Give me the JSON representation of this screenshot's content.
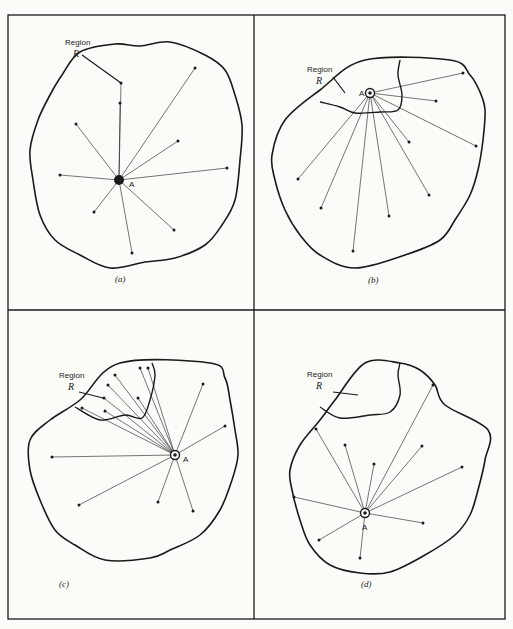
{
  "figure": {
    "frame": {
      "x": 8,
      "y": 15,
      "width": 497,
      "height": 604,
      "split_x": 254,
      "split_y": 310
    },
    "colors": {
      "ink": "#1a1a1a",
      "paper": "#fbfbf8"
    },
    "region_label": "Region",
    "region_symbol": "R",
    "point_label": "A",
    "panels": [
      {
        "id": "a",
        "caption": "(a)",
        "caption_pos": [
          115,
          282
        ],
        "outline": [
          [
            62,
            75
          ],
          [
            80,
            52
          ],
          [
            115,
            44
          ],
          [
            140,
            46
          ],
          [
            170,
            42
          ],
          [
            205,
            55
          ],
          [
            225,
            70
          ],
          [
            235,
            95
          ],
          [
            242,
            125
          ],
          [
            240,
            160
          ],
          [
            235,
            200
          ],
          [
            222,
            225
          ],
          [
            205,
            245
          ],
          [
            175,
            258
          ],
          [
            145,
            262
          ],
          [
            110,
            268
          ],
          [
            80,
            255
          ],
          [
            55,
            240
          ],
          [
            40,
            215
          ],
          [
            33,
            180
          ],
          [
            30,
            150
          ],
          [
            38,
            120
          ],
          [
            50,
            95
          ]
        ],
        "subregion": null,
        "region_text_pos": [
          65,
          45
        ],
        "region_sym_pos": [
          73,
          57
        ],
        "arrow": [
          [
            82,
            55
          ],
          [
            121,
            83
          ]
        ],
        "A": [
          119,
          180
        ],
        "A_label_pos": [
          129,
          187
        ],
        "points": [
          [
            121,
            83
          ],
          [
            120,
            103
          ],
          [
            195,
            68
          ],
          [
            76,
            124
          ],
          [
            178,
            141
          ],
          [
            60,
            175
          ],
          [
            227,
            168
          ],
          [
            94,
            212
          ],
          [
            174,
            230
          ],
          [
            132,
            253
          ]
        ]
      },
      {
        "id": "b",
        "caption": "(b)",
        "caption_pos": [
          368,
          283
        ],
        "outline": [
          [
            365,
            60
          ],
          [
            450,
            60
          ],
          [
            470,
            75
          ],
          [
            480,
            92
          ],
          [
            485,
            110
          ],
          [
            483,
            140
          ],
          [
            478,
            170
          ],
          [
            470,
            195
          ],
          [
            455,
            220
          ],
          [
            440,
            240
          ],
          [
            405,
            255
          ],
          [
            355,
            268
          ],
          [
            320,
            255
          ],
          [
            300,
            235
          ],
          [
            285,
            210
          ],
          [
            275,
            180
          ],
          [
            272,
            155
          ],
          [
            285,
            120
          ],
          [
            320,
            90
          ]
        ],
        "subregion": [
          [
            320,
            102
          ],
          [
            340,
            107
          ],
          [
            355,
            113
          ],
          [
            380,
            112
          ],
          [
            398,
            110
          ],
          [
            402,
            95
          ],
          [
            398,
            75
          ],
          [
            400,
            60
          ]
        ],
        "region_text_pos": [
          307,
          72
        ],
        "region_sym_pos": [
          316,
          84
        ],
        "arrow": [
          [
            333,
            77
          ],
          [
            345,
            93
          ]
        ],
        "A": [
          370,
          93
        ],
        "A_label_pos": [
          359,
          96
        ],
        "points": [
          [
            463,
            73
          ],
          [
            436,
            101
          ],
          [
            476,
            146
          ],
          [
            409,
            142
          ],
          [
            298,
            179
          ],
          [
            321,
            208
          ],
          [
            353,
            251
          ],
          [
            389,
            216
          ],
          [
            429,
            195
          ]
        ]
      },
      {
        "id": "c",
        "caption": "(c)",
        "caption_pos": [
          59,
          587
        ],
        "outline": [
          [
            120,
            363
          ],
          [
            210,
            363
          ],
          [
            225,
            378
          ],
          [
            230,
            400
          ],
          [
            235,
            430
          ],
          [
            238,
            455
          ],
          [
            232,
            480
          ],
          [
            220,
            510
          ],
          [
            200,
            535
          ],
          [
            170,
            550
          ],
          [
            150,
            558
          ],
          [
            105,
            560
          ],
          [
            75,
            545
          ],
          [
            55,
            530
          ],
          [
            40,
            500
          ],
          [
            30,
            470
          ],
          [
            30,
            440
          ],
          [
            50,
            420
          ],
          [
            80,
            400
          ]
        ],
        "subregion": [
          [
            75,
            407
          ],
          [
            100,
            420
          ],
          [
            125,
            415
          ],
          [
            142,
            418
          ],
          [
            150,
            400
          ],
          [
            155,
            375
          ],
          [
            152,
            363
          ]
        ],
        "region_text_pos": [
          59,
          378
        ],
        "region_sym_pos": [
          68,
          390
        ],
        "arrow": [
          [
            79,
            392
          ],
          [
            103,
            398
          ]
        ],
        "A": [
          175,
          455
        ],
        "A_label_pos": [
          183,
          462
        ],
        "points": [
          [
            115,
            375
          ],
          [
            140,
            368
          ],
          [
            148,
            368
          ],
          [
            108,
            385
          ],
          [
            104,
            398
          ],
          [
            138,
            398
          ],
          [
            82,
            408
          ],
          [
            105,
            411
          ],
          [
            203,
            384
          ],
          [
            225,
            426
          ],
          [
            52,
            457
          ],
          [
            79,
            505
          ],
          [
            158,
            502
          ],
          [
            193,
            511
          ]
        ]
      },
      {
        "id": "d",
        "caption": "(d)",
        "caption_pos": [
          361,
          587
        ],
        "outline": [
          [
            365,
            363
          ],
          [
            400,
            363
          ],
          [
            420,
            370
          ],
          [
            435,
            385
          ],
          [
            445,
            405
          ],
          [
            488,
            430
          ],
          [
            485,
            460
          ],
          [
            478,
            490
          ],
          [
            470,
            515
          ],
          [
            455,
            535
          ],
          [
            425,
            555
          ],
          [
            390,
            572
          ],
          [
            360,
            573
          ],
          [
            330,
            565
          ],
          [
            310,
            545
          ],
          [
            300,
            520
          ],
          [
            292,
            490
          ],
          [
            290,
            470
          ],
          [
            300,
            445
          ],
          [
            320,
            420
          ],
          [
            335,
            400
          ]
        ],
        "subregion": [
          [
            320,
            407
          ],
          [
            340,
            418
          ],
          [
            370,
            415
          ],
          [
            390,
            412
          ],
          [
            400,
            395
          ],
          [
            398,
            375
          ],
          [
            400,
            363
          ]
        ],
        "region_text_pos": [
          307,
          377
        ],
        "region_sym_pos": [
          316,
          389
        ],
        "arrow": [
          [
            333,
            392
          ],
          [
            358,
            395
          ]
        ],
        "A": [
          365,
          513
        ],
        "A_label_pos": [
          362,
          530
        ],
        "points": [
          [
            433,
            385
          ],
          [
            316,
            429
          ],
          [
            345,
            445
          ],
          [
            422,
            446
          ],
          [
            374,
            464
          ],
          [
            462,
            467
          ],
          [
            294,
            497
          ],
          [
            423,
            523
          ],
          [
            319,
            540
          ],
          [
            360,
            558
          ]
        ]
      }
    ]
  }
}
